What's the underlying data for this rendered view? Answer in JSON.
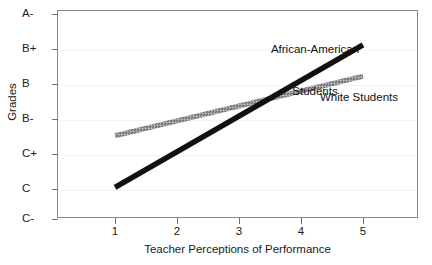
{
  "chart_data": {
    "type": "line",
    "title": "",
    "xlabel": "Teacher Perceptions of Performance",
    "ylabel": "Grades",
    "xlim": [
      0.6,
      5.75
    ],
    "xticks": [
      1,
      2,
      3,
      4,
      5
    ],
    "xticklabels": [
      "1",
      "2",
      "3",
      "4",
      "5"
    ],
    "yticklabels": [
      "A-",
      "B+",
      "B",
      "B-",
      "C+",
      "C",
      "C-"
    ],
    "ylim_labels": [
      "C-",
      "A-"
    ],
    "grid": "faint horizontal gridlines at each grade level",
    "legend": "inline annotations next to each line",
    "series": [
      {
        "name": "African-American Students",
        "style": "thick solid black",
        "color": "#111111",
        "x": [
          1,
          5
        ],
        "y_labels": [
          "C",
          "B+"
        ],
        "y_values": [
          1.05,
          5.12
        ]
      },
      {
        "name": "White Students",
        "style": "medium hatched gray",
        "color": "#8c8c8c",
        "x": [
          1,
          5
        ],
        "y_labels": [
          "C+",
          "B"
        ],
        "y_values": [
          2.52,
          4.22
        ]
      }
    ],
    "intersection": {
      "x": 3.3,
      "y_label": "B-"
    },
    "annotations": [
      {
        "text": "African-American\nStudents",
        "target": "African-American Students"
      },
      {
        "text": "White Students",
        "target": "White Students"
      }
    ]
  },
  "axis": {
    "y_ticks": [
      {
        "label": "A-",
        "y": 14
      },
      {
        "label": "B+",
        "y": 49
      },
      {
        "label": "B",
        "y": 84
      },
      {
        "label": "B-",
        "y": 119
      },
      {
        "label": "C+",
        "y": 154
      },
      {
        "label": "C",
        "y": 189
      },
      {
        "label": "C-",
        "y": 219
      }
    ],
    "x_ticks": [
      {
        "label": "1",
        "x": 115
      },
      {
        "label": "2",
        "x": 177
      },
      {
        "label": "3",
        "x": 239
      },
      {
        "label": "4",
        "x": 301
      },
      {
        "label": "5",
        "x": 363
      }
    ],
    "x_title": "Teacher Perceptions of Performance",
    "y_title": "Grades"
  },
  "annotations": {
    "african_american_line1": "African-American",
    "african_american_line2": "Students",
    "white": "White Students"
  },
  "colors": {
    "frame": "#8a8a8a",
    "grid": "#f4f4f6",
    "african_american": "#111111",
    "white_students": "#8c8c8c",
    "text": "#1a1a1a"
  }
}
